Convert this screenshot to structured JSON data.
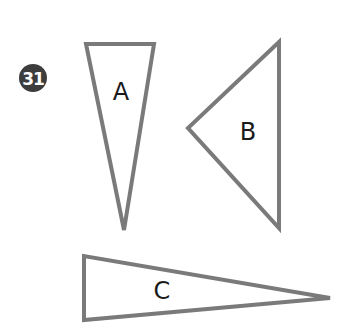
{
  "problem": {
    "number": "31"
  },
  "colors": {
    "stroke": "#7a7a7a",
    "badge": "#3d3d3d",
    "label": "#1a1a1a",
    "background": "#ffffff"
  },
  "triangles": [
    {
      "label": "A",
      "points": "86,44 154,44 124,230",
      "label_pos": [
        121,
        93
      ]
    },
    {
      "label": "B",
      "points": "279,42 188,128 279,228",
      "label_pos": [
        248,
        133
      ]
    },
    {
      "label": "C",
      "points": "84,256 84,320 330,298",
      "label_pos": [
        162,
        292
      ]
    }
  ]
}
